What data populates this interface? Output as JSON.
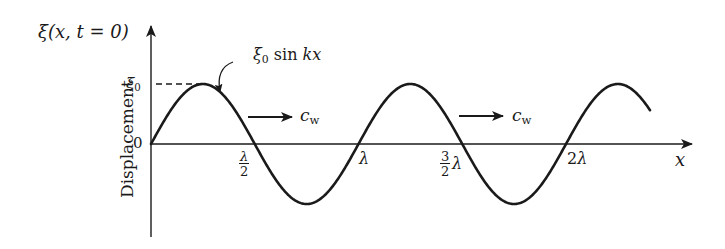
{
  "figure": {
    "function_label": "ξ(x, t = 0)",
    "y_axis_label": "Displacement",
    "x_axis_label": "x",
    "curve_label": "ξ₀ sin kx",
    "amplitude_label": "ξ₀",
    "origin_label": "0",
    "velocity_label_1": "c_w",
    "velocity_label_2": "c_w",
    "x_ticks": [
      {
        "label": "λ/2",
        "numerator": "λ",
        "denominator": "2"
      },
      {
        "label": "λ"
      },
      {
        "label": "3/2 λ",
        "numerator": "3",
        "denominator": "2",
        "suffix": "λ"
      },
      {
        "label": "2λ"
      }
    ]
  },
  "colors": {
    "line": "#1a1a1a",
    "background": "#ffffff"
  }
}
